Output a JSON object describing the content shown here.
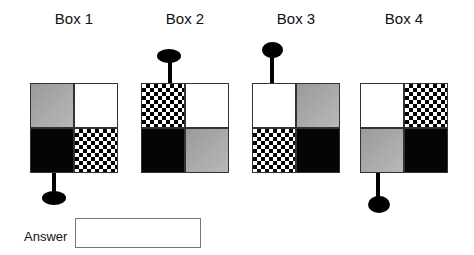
{
  "boxes": [
    {
      "title": "Box 1",
      "cells": [
        "gray",
        "white",
        "black",
        "checker"
      ],
      "pin": {
        "position": "bottom",
        "side": "left"
      }
    },
    {
      "title": "Box 2",
      "cells": [
        "checker",
        "white",
        "black",
        "gray"
      ],
      "pin": {
        "position": "top",
        "side": "left"
      }
    },
    {
      "title": "Box 3",
      "cells": [
        "white",
        "gray",
        "checker",
        "black"
      ],
      "pin": {
        "position": "top",
        "side": "left"
      }
    },
    {
      "title": "Box 4",
      "cells": [
        "white",
        "checker",
        "gray",
        "black"
      ],
      "pin": {
        "position": "bottom",
        "side": "left"
      }
    }
  ],
  "answer": {
    "label": "Answer",
    "value": ""
  }
}
